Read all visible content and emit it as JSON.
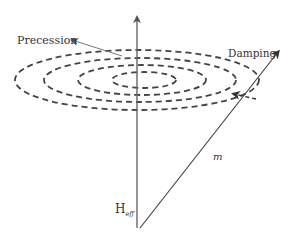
{
  "diagram": {
    "labels": {
      "precession": "Precession",
      "damping": "Damping",
      "m": "m",
      "h_main": "H",
      "h_sub": "eff"
    },
    "colors": {
      "line": "#555555",
      "dashed": "#444444",
      "text": "#333333",
      "background": "#ffffff"
    },
    "elements": {
      "axis": "vertical effective-field axis with arrowhead",
      "ellipses": "4 concentric dashed ellipses (spiral precession path)",
      "magnetization_vector": "diagonal arrow m",
      "damping_arrow": "dashed arrow pointing inward toward axis"
    }
  }
}
